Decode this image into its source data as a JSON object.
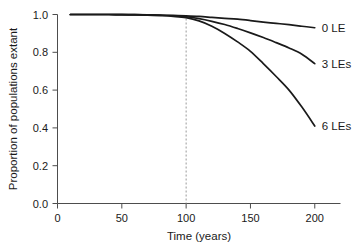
{
  "chart_data": {
    "type": "line",
    "title": "",
    "xlabel": "Time (years)",
    "ylabel": "Proportion of populations extant",
    "xlim": [
      0,
      220
    ],
    "ylim": [
      0.0,
      1.0
    ],
    "xticks": [
      0,
      50,
      100,
      150,
      200
    ],
    "xtick_labels": [
      "0",
      "50",
      "100",
      "150",
      "200"
    ],
    "yticks": [
      0.0,
      0.2,
      0.4,
      0.6,
      0.8,
      1.0
    ],
    "ytick_labels": [
      "0.0",
      "0.2",
      "0.4",
      "0.6",
      "0.8",
      "1.0"
    ],
    "grid": false,
    "legend_position": "right-inline-labels",
    "annotations": [
      {
        "name": "dashed-vertical-line",
        "type": "vline",
        "x": 100,
        "style": "dashed",
        "color": "#9a9a9a"
      }
    ],
    "x": [
      10,
      20,
      30,
      40,
      50,
      60,
      70,
      80,
      90,
      100,
      110,
      120,
      130,
      140,
      150,
      160,
      170,
      180,
      190,
      200
    ],
    "series": [
      {
        "name": "0 LE",
        "label": "0 LE",
        "color": "#1a1a1a",
        "values": [
          1.0,
          1.0,
          1.0,
          1.0,
          0.999,
          0.999,
          0.998,
          0.997,
          0.995,
          0.993,
          0.99,
          0.985,
          0.98,
          0.975,
          0.968,
          0.96,
          0.953,
          0.946,
          0.938,
          0.93
        ]
      },
      {
        "name": "3 LEs",
        "label": "3 LEs",
        "color": "#1a1a1a",
        "values": [
          1.0,
          1.0,
          1.0,
          1.0,
          0.999,
          0.999,
          0.998,
          0.996,
          0.993,
          0.988,
          0.978,
          0.964,
          0.947,
          0.926,
          0.903,
          0.878,
          0.851,
          0.823,
          0.79,
          0.74
        ]
      },
      {
        "name": "6 LEs",
        "label": "6 LEs",
        "color": "#1a1a1a",
        "values": [
          1.0,
          1.0,
          1.0,
          1.0,
          0.999,
          0.998,
          0.997,
          0.994,
          0.99,
          0.983,
          0.966,
          0.938,
          0.9,
          0.855,
          0.805,
          0.74,
          0.672,
          0.6,
          0.51,
          0.41
        ]
      }
    ]
  },
  "axis": {
    "x_title": "Time (years)",
    "y_title": "Proportion of populations extant"
  },
  "series_labels": {
    "s0": "0 LE",
    "s1": "3 LEs",
    "s2": "6 LEs"
  }
}
